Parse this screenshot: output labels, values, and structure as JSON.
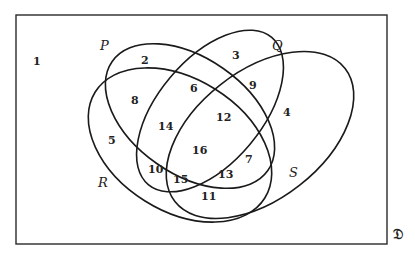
{
  "diagram": {
    "type": "venn-4-set",
    "universe": {
      "label": "𝔇",
      "region_label": "1"
    },
    "sets": [
      {
        "name": "P",
        "label": "P"
      },
      {
        "name": "Q",
        "label": "Q"
      },
      {
        "name": "R",
        "label": "R"
      },
      {
        "name": "S",
        "label": "S"
      }
    ],
    "regions": [
      {
        "id": "1",
        "label": "1",
        "membership": "outside all"
      },
      {
        "id": "2",
        "label": "2",
        "membership": "P only"
      },
      {
        "id": "3",
        "label": "3",
        "membership": "Q only"
      },
      {
        "id": "4",
        "label": "4",
        "membership": "S only"
      },
      {
        "id": "5",
        "label": "5",
        "membership": "R only"
      },
      {
        "id": "6",
        "label": "6",
        "membership": "P ∩ Q"
      },
      {
        "id": "7",
        "label": "7",
        "membership": "Q ∩ S"
      },
      {
        "id": "8",
        "label": "8",
        "membership": "P ∩ R"
      },
      {
        "id": "9",
        "label": "9",
        "membership": "Q ∩ S"
      },
      {
        "id": "10",
        "label": "10",
        "membership": "R ∩ S"
      },
      {
        "id": "11",
        "label": "11",
        "membership": "R ∩ S"
      },
      {
        "id": "12",
        "label": "12",
        "membership": "P ∩ Q ∩ S"
      },
      {
        "id": "13",
        "label": "13",
        "membership": "P ∩ R ∩ S"
      },
      {
        "id": "14",
        "label": "14",
        "membership": "P ∩ Q ∩ R"
      },
      {
        "id": "15",
        "label": "15",
        "membership": "Q ∩ R ∩ S"
      },
      {
        "id": "16",
        "label": "16",
        "membership": "P ∩ Q ∩ R ∩ S"
      }
    ]
  }
}
